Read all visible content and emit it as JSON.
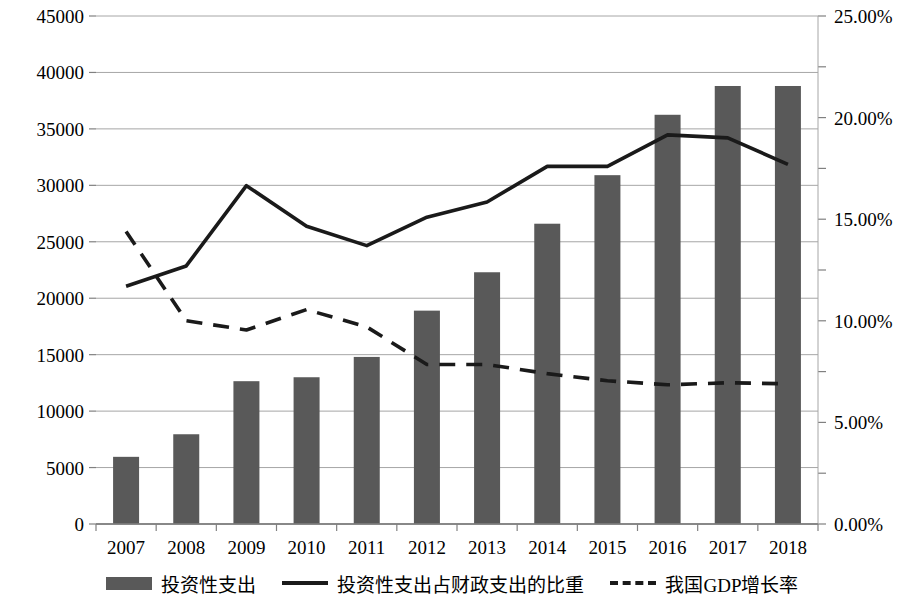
{
  "chart_data": {
    "type": "bar",
    "title": "",
    "xlabel": "",
    "ylabel": "",
    "categories": [
      "2007",
      "2008",
      "2009",
      "2010",
      "2011",
      "2012",
      "2013",
      "2014",
      "2015",
      "2016",
      "2017",
      "2018"
    ],
    "grid": true,
    "legend_position": "bottom",
    "left_axis": {
      "ylim": [
        0,
        45000
      ],
      "tick_step": 5000,
      "ticks": [
        "0",
        "5000",
        "10000",
        "15000",
        "20000",
        "25000",
        "30000",
        "35000",
        "40000",
        "45000"
      ],
      "tick_values": [
        0,
        5000,
        10000,
        15000,
        20000,
        25000,
        30000,
        35000,
        40000,
        45000
      ]
    },
    "right_axis": {
      "ylim": [
        0,
        25
      ],
      "tick_step": 2.5,
      "labeled_ticks": [
        "0.00%",
        "5.00%",
        "10.00%",
        "15.00%",
        "20.00%",
        "25.00%"
      ],
      "labeled_tick_values": [
        0,
        5,
        10,
        15,
        20,
        25
      ],
      "minor_tick_values": [
        2.5,
        7.5,
        12.5,
        17.5,
        22.5
      ]
    },
    "series": [
      {
        "name": "投资性支出",
        "type": "bar",
        "axis": "left",
        "color": "#595959",
        "values": [
          5950,
          7950,
          12650,
          13000,
          14800,
          18900,
          22300,
          26600,
          30900,
          36250,
          38800,
          38800
        ]
      },
      {
        "name": "投资性支出占财政支出的比重",
        "type": "line",
        "style": "solid",
        "axis": "right",
        "color": "#1a1a1a",
        "values": [
          11.7,
          12.7,
          16.65,
          14.65,
          13.7,
          15.1,
          15.85,
          17.6,
          17.6,
          19.15,
          19.0,
          17.7
        ]
      },
      {
        "name": "我国GDP增长率",
        "type": "line",
        "style": "dashed",
        "axis": "right",
        "color": "#1a1a1a",
        "values": [
          14.4,
          10.0,
          9.55,
          10.55,
          9.7,
          7.85,
          7.85,
          7.4,
          7.05,
          6.85,
          6.95,
          6.9
        ]
      }
    ]
  },
  "legend": {
    "items": [
      {
        "label": "投资性支出",
        "marker": "bar-swatch"
      },
      {
        "label": "投资性支出占财政支出的比重",
        "marker": "solid-line-swatch"
      },
      {
        "label": "我国GDP增长率",
        "marker": "dashed-line-swatch"
      }
    ]
  }
}
